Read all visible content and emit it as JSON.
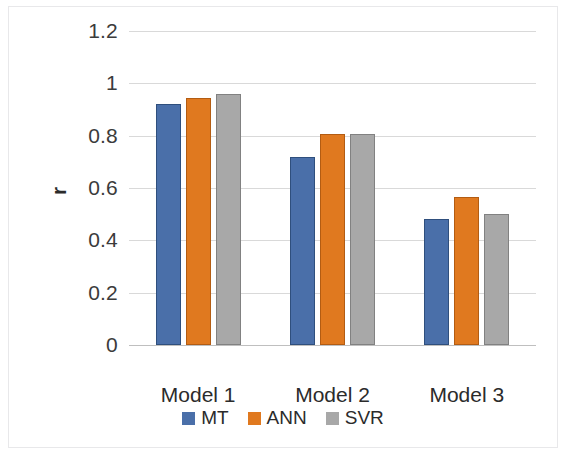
{
  "chart_data": {
    "type": "bar",
    "title": "",
    "xlabel": "",
    "ylabel": "r",
    "ylim": [
      0,
      1.2
    ],
    "yticks": [
      "0",
      "0.2",
      "0.4",
      "0.6",
      "0.8",
      "1",
      "1.2"
    ],
    "ytick_values": [
      0,
      0.2,
      0.4,
      0.6,
      0.8,
      1.0,
      1.2
    ],
    "grid": true,
    "legend_position": "bottom",
    "categories": [
      "Model 1",
      "Model 2",
      "Model 3"
    ],
    "series": [
      {
        "name": "MT",
        "color": "#4a6fa9",
        "values": [
          0.92,
          0.72,
          0.48
        ]
      },
      {
        "name": "ANN",
        "color": "#e0791f",
        "values": [
          0.945,
          0.805,
          0.565
        ]
      },
      {
        "name": "SVR",
        "color": "#a8a8a8",
        "values": [
          0.96,
          0.805,
          0.5
        ]
      }
    ]
  },
  "axis": {
    "y_title": "r",
    "ticks": [
      {
        "label": "1.2",
        "value": 1.2
      },
      {
        "label": "1",
        "value": 1.0
      },
      {
        "label": "0.8",
        "value": 0.8
      },
      {
        "label": "0.6",
        "value": 0.6
      },
      {
        "label": "0.4",
        "value": 0.4
      },
      {
        "label": "0.2",
        "value": 0.2
      },
      {
        "label": "0",
        "value": 0.0
      }
    ]
  },
  "categories": [
    {
      "label": "Model 1"
    },
    {
      "label": "Model 2"
    },
    {
      "label": "Model 3"
    }
  ],
  "legend": {
    "items": [
      {
        "label": "MT",
        "color": "#4a6fa9"
      },
      {
        "label": "ANN",
        "color": "#e0791f"
      },
      {
        "label": "SVR",
        "color": "#a8a8a8"
      }
    ]
  },
  "colors": {
    "mt": "#4a6fa9",
    "ann": "#e0791f",
    "svr": "#a8a8a8",
    "gridline": "#d9d9d9",
    "axis": "#bfbfbf",
    "text": "#2b2b2b",
    "frame": "#e8e8ea",
    "background": "#ffffff"
  }
}
